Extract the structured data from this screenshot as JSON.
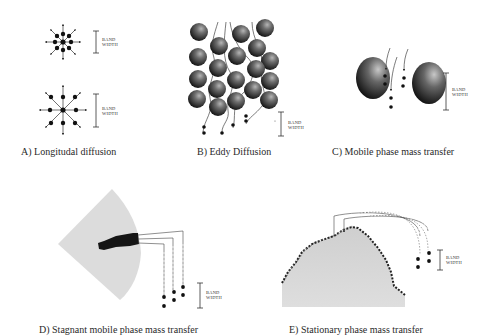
{
  "figure": {
    "panels": [
      {
        "id": "A",
        "caption": "A)  Longitudal diffusion",
        "band_label": [
          "BAND",
          "WIDTH"
        ]
      },
      {
        "id": "B",
        "caption": "B)  Eddy Diffusion",
        "band_label": [
          "BAND",
          "WIDTH"
        ]
      },
      {
        "id": "C",
        "caption": "C)  Mobile phase mass transfer",
        "band_label": [
          "BAND",
          "WIDTH"
        ]
      },
      {
        "id": "D",
        "caption": "D)  Stagnant mobile phase mass transfer",
        "band_label": [
          "BAND",
          "WIDTH"
        ]
      },
      {
        "id": "E",
        "caption": "E)  Stationary phase mass transfer",
        "band_label": [
          "BAND",
          "WIDTH"
        ]
      }
    ],
    "colors": {
      "particle_dark": "#1a1a1a",
      "particle_light": "#9a9a9a",
      "pore_fill": "#d8d8d8",
      "molecule": "#111111",
      "line": "#333333"
    }
  }
}
